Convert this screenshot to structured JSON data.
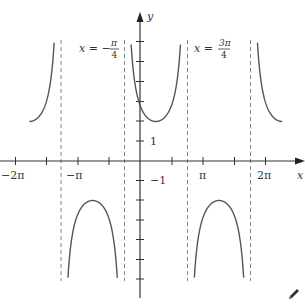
{
  "chart_data": {
    "type": "line",
    "title": "",
    "function": "y = 2 sec(x - π/4)",
    "xlabel": "x",
    "ylabel": "y",
    "xlim": [
      -2.2,
      9.0
    ],
    "x_domain_plotted": [
      -5.498,
      7.069
    ],
    "ylim": [
      -6.5,
      7.5
    ],
    "clip_y": [
      -6,
      6
    ],
    "x_ticks": [
      {
        "value": -6.2832,
        "label": "−2π"
      },
      {
        "value": -4.7124,
        "label": ""
      },
      {
        "value": -3.1416,
        "label": "−π"
      },
      {
        "value": -1.5708,
        "label": ""
      },
      {
        "value": 1.5708,
        "label": ""
      },
      {
        "value": 3.1416,
        "label": "π"
      },
      {
        "value": 4.7124,
        "label": ""
      },
      {
        "value": 6.2832,
        "label": "2π"
      }
    ],
    "y_ticks": [
      {
        "value": 6,
        "label": ""
      },
      {
        "value": 5,
        "label": ""
      },
      {
        "value": 4,
        "label": ""
      },
      {
        "value": 3,
        "label": ""
      },
      {
        "value": 2,
        "label": ""
      },
      {
        "value": 1,
        "label": "1"
      },
      {
        "value": -1,
        "label": "−1"
      },
      {
        "value": -2,
        "label": ""
      },
      {
        "value": -3,
        "label": ""
      },
      {
        "value": -4,
        "label": ""
      },
      {
        "value": -5,
        "label": ""
      },
      {
        "value": -6,
        "label": ""
      }
    ],
    "asymptotes": [
      {
        "x": -3.927,
        "label": ""
      },
      {
        "x": -0.7854,
        "label": "x = −π/4"
      },
      {
        "x": 2.3562,
        "label": "x = 3π/4"
      },
      {
        "x": 5.4978,
        "label": ""
      }
    ],
    "branches": [
      {
        "interval": [
          -5.498,
          -3.927
        ],
        "vertex": {
          "x": -5.498,
          "y": 2
        },
        "opens": "up"
      },
      {
        "interval": [
          -3.927,
          -0.785
        ],
        "vertex": {
          "x": -2.356,
          "y": -2
        },
        "opens": "down"
      },
      {
        "interval": [
          -0.785,
          2.356
        ],
        "vertex": {
          "x": 0.785,
          "y": 2
        },
        "opens": "up"
      },
      {
        "interval": [
          2.356,
          5.498
        ],
        "vertex": {
          "x": 3.927,
          "y": -2
        },
        "opens": "down"
      },
      {
        "interval": [
          5.498,
          7.069
        ],
        "vertex": {
          "x": 7.069,
          "y": 2
        },
        "opens": "up"
      }
    ],
    "grid": false,
    "legend": null,
    "colors": {
      "curve": "#555555",
      "axis": "#333333",
      "asymptote": "#888888"
    }
  },
  "labels": {
    "x_axis": "x",
    "y_axis": "y",
    "asym_left_lhs": "x = −",
    "asym_left_num": "π",
    "asym_left_den": "4",
    "asym_right_lhs": "x = ",
    "asym_right_num": "3π",
    "asym_right_den": "4",
    "tick_neg2pi": "−2π",
    "tick_negpi": "−π",
    "tick_pi": "π",
    "tick_2pi": "2π",
    "tick_1": "1",
    "tick_neg1": "−1"
  },
  "toolbar": {
    "edit_icon": "pencil-icon"
  }
}
